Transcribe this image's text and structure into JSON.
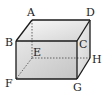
{
  "diagram": {
    "type": "cuboid",
    "colors": {
      "edge": "#1a1a1a",
      "hidden_edge": "#555555",
      "face_light": "#f2f2f2",
      "face_dark": "#c8c8c8"
    },
    "vertices": {
      "A": {
        "label": "A",
        "x": 32,
        "y": 20
      },
      "B": {
        "label": "B",
        "x": 16,
        "y": 41
      },
      "C": {
        "label": "C",
        "x": 77,
        "y": 41
      },
      "D": {
        "label": "D",
        "x": 90,
        "y": 20
      },
      "E": {
        "label": "E",
        "x": 32,
        "y": 58
      },
      "F": {
        "label": "F",
        "x": 16,
        "y": 79
      },
      "G": {
        "label": "G",
        "x": 77,
        "y": 79
      },
      "H": {
        "label": "H",
        "x": 90,
        "y": 58
      }
    },
    "visible_edges": [
      "AB",
      "AD",
      "DC",
      "BC",
      "BF",
      "CG",
      "FG",
      "DH",
      "HG"
    ],
    "hidden_edges": [
      "AE",
      "EF",
      "EH"
    ]
  }
}
